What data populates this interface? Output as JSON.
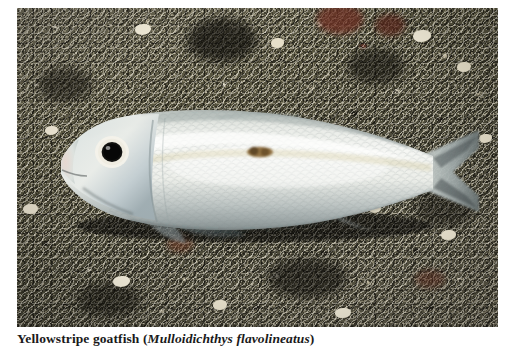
{
  "figure": {
    "caption_common_name": "Yellowstripe goatfish",
    "caption_open_paren": " (",
    "caption_scientific_name": "Mulloidichthys flavolineatus",
    "caption_close_paren": ")",
    "caption_full": "Yellowstripe goatfish (Mulloidichthys flavolineatus)"
  },
  "photo": {
    "subject": "goatfish",
    "habitat": "coarse volcanic sand seabed",
    "orientation": "facing left, lateral view",
    "colors": {
      "fish_body_highlight": "#f4f5f2",
      "fish_body_mid": "#dfe2dd",
      "fish_belly_shadow": "#b9c0bd",
      "fish_head_blue": "#c3cfd2",
      "fish_eye_pupil": "#0b0b0b",
      "fish_eye_ring": "#f2f1ea",
      "lateral_spot": "#8a6a3c",
      "fin_translucent": "#9aa8ac",
      "fin_ray_dark": "#2b3234",
      "substrate_base": "#5d5a4c",
      "substrate_light_grain": "#efe9d8",
      "substrate_dark_grain": "#12110d",
      "substrate_red_rock": "#6b2c22",
      "page_background": "#ffffff",
      "caption_text": "#1a1a1a"
    },
    "features": {
      "eye": "large round dark eye near snout",
      "lateral_marking": "small dark golden-brown blotch mid-body",
      "pectoral_fin": "translucent fan-shaped fin with dark rays",
      "tail": "forked caudal fin at right edge, partly cut off",
      "scales": "fine reticulated scale pattern along flank"
    }
  }
}
